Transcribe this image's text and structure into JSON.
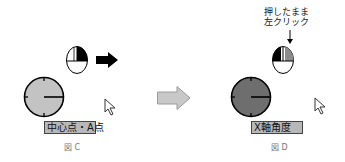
{
  "figure_c": {
    "caption": "図 C",
    "label": "中心点・A点",
    "clock_fill": "#c3c3c3",
    "mouse_pressed_button": "right"
  },
  "figure_d": {
    "caption": "図 D",
    "label": "X軸角度",
    "clock_fill": "#6e6e6e",
    "mouse_pressed_button": "left",
    "instruction_line1": "押したまま",
    "instruction_line2": "左クリック"
  },
  "transition_arrow_color": "#c8c8c8",
  "direction_arrow_color": "#000000"
}
